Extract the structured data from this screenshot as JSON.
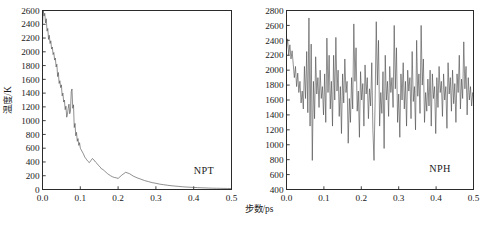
{
  "figure": {
    "axis_x_title": "步数/ps",
    "axis_y_title": "温度/K",
    "line_color": "#4a4a4a",
    "axis_color": "#2b2b2b",
    "background": "#ffffff"
  },
  "panels": {
    "left": {
      "annotation": "NPT"
    },
    "right": {
      "annotation": "NPH"
    }
  },
  "chart_data": [
    {
      "type": "line",
      "title": "",
      "annotation": "NPT",
      "xlabel": "步数/ps",
      "ylabel": "温度/K",
      "xlim": [
        0.0,
        0.5
      ],
      "ylim": [
        0,
        2600
      ],
      "xticks": [
        0.0,
        0.1,
        0.2,
        0.3,
        0.4,
        0.5
      ],
      "xtick_labels": [
        "0.0",
        "0.1",
        "0.2",
        "0.3",
        "0.4",
        "0.5"
      ],
      "yticks": [
        0,
        200,
        400,
        600,
        800,
        1000,
        1200,
        1400,
        1600,
        1800,
        2000,
        2200,
        2400,
        2600
      ],
      "ytick_labels": [
        "0",
        "200",
        "400",
        "600",
        "800",
        "1000",
        "1200",
        "1400",
        "1600",
        "1800",
        "2000",
        "2200",
        "2400",
        "2600"
      ],
      "grid": false,
      "legend": "none",
      "series": [
        {
          "name": "NPT temperature",
          "x": [
            0.0,
            0.002,
            0.004,
            0.006,
            0.008,
            0.01,
            0.012,
            0.014,
            0.016,
            0.018,
            0.02,
            0.022,
            0.024,
            0.026,
            0.028,
            0.03,
            0.032,
            0.034,
            0.036,
            0.038,
            0.04,
            0.042,
            0.044,
            0.046,
            0.048,
            0.05,
            0.052,
            0.054,
            0.056,
            0.058,
            0.06,
            0.062,
            0.064,
            0.066,
            0.068,
            0.07,
            0.072,
            0.074,
            0.076,
            0.078,
            0.08,
            0.082,
            0.084,
            0.086,
            0.088,
            0.09,
            0.092,
            0.094,
            0.096,
            0.098,
            0.1,
            0.104,
            0.108,
            0.112,
            0.116,
            0.12,
            0.124,
            0.128,
            0.132,
            0.136,
            0.14,
            0.144,
            0.148,
            0.152,
            0.156,
            0.16,
            0.164,
            0.168,
            0.172,
            0.176,
            0.18,
            0.185,
            0.19,
            0.195,
            0.2,
            0.21,
            0.22,
            0.23,
            0.24,
            0.25,
            0.26,
            0.27,
            0.28,
            0.29,
            0.3,
            0.31,
            0.32,
            0.33,
            0.34,
            0.35,
            0.36,
            0.37,
            0.38,
            0.39,
            0.4,
            0.41,
            0.42,
            0.43,
            0.44,
            0.45,
            0.46,
            0.47,
            0.48,
            0.49,
            0.5
          ],
          "y": [
            2380,
            2600,
            2520,
            2560,
            2420,
            2480,
            2300,
            2340,
            2180,
            2240,
            2120,
            2160,
            2040,
            2070,
            1960,
            1990,
            1880,
            1910,
            1780,
            1820,
            1640,
            1700,
            1540,
            1580,
            1480,
            1520,
            1360,
            1400,
            1270,
            1300,
            1160,
            1210,
            1050,
            1090,
            1180,
            1240,
            1100,
            1140,
            1420,
            1460,
            1180,
            1230,
            900,
            960,
            780,
            830,
            700,
            740,
            640,
            680,
            600,
            560,
            520,
            470,
            440,
            410,
            390,
            420,
            450,
            430,
            400,
            380,
            350,
            330,
            300,
            290,
            270,
            250,
            230,
            215,
            200,
            185,
            175,
            170,
            160,
            210,
            250,
            230,
            195,
            170,
            150,
            130,
            115,
            100,
            90,
            78,
            70,
            62,
            55,
            50,
            45,
            40,
            36,
            33,
            30,
            27,
            25,
            23,
            21,
            19,
            18,
            17,
            16,
            15,
            14
          ]
        }
      ]
    },
    {
      "type": "line",
      "title": "",
      "annotation": "NPH",
      "xlabel": "步数/ps",
      "ylabel": "温度/K",
      "xlim": [
        0.0,
        0.5
      ],
      "ylim": [
        400,
        2800
      ],
      "xticks": [
        0.0,
        0.1,
        0.2,
        0.3,
        0.4,
        0.5
      ],
      "xtick_labels": [
        "0.0",
        "0.1",
        "0.2",
        "0.3",
        "0.4",
        "0.5"
      ],
      "yticks": [
        400,
        600,
        800,
        1000,
        1200,
        1400,
        1600,
        1800,
        2000,
        2200,
        2400,
        2600,
        2800
      ],
      "ytick_labels": [
        "400",
        "600",
        "800",
        "1000",
        "1200",
        "1400",
        "1600",
        "1800",
        "2000",
        "2200",
        "2400",
        "2600",
        "2800"
      ],
      "grid": false,
      "legend": "none",
      "series": [
        {
          "name": "NPH temperature",
          "x": [
            0.0,
            0.003,
            0.006,
            0.009,
            0.012,
            0.015,
            0.018,
            0.021,
            0.024,
            0.027,
            0.03,
            0.033,
            0.036,
            0.039,
            0.042,
            0.045,
            0.048,
            0.051,
            0.054,
            0.057,
            0.06,
            0.063,
            0.066,
            0.069,
            0.072,
            0.075,
            0.078,
            0.081,
            0.084,
            0.087,
            0.09,
            0.093,
            0.096,
            0.099,
            0.102,
            0.105,
            0.108,
            0.111,
            0.114,
            0.117,
            0.12,
            0.123,
            0.126,
            0.129,
            0.132,
            0.135,
            0.138,
            0.141,
            0.144,
            0.147,
            0.15,
            0.153,
            0.156,
            0.159,
            0.162,
            0.165,
            0.168,
            0.171,
            0.174,
            0.177,
            0.18,
            0.183,
            0.186,
            0.189,
            0.192,
            0.195,
            0.198,
            0.201,
            0.204,
            0.207,
            0.21,
            0.213,
            0.216,
            0.219,
            0.222,
            0.225,
            0.228,
            0.231,
            0.234,
            0.237,
            0.24,
            0.243,
            0.246,
            0.249,
            0.252,
            0.255,
            0.258,
            0.261,
            0.264,
            0.267,
            0.27,
            0.273,
            0.276,
            0.279,
            0.282,
            0.285,
            0.288,
            0.291,
            0.294,
            0.297,
            0.3,
            0.303,
            0.306,
            0.309,
            0.312,
            0.315,
            0.318,
            0.321,
            0.324,
            0.327,
            0.33,
            0.333,
            0.336,
            0.339,
            0.342,
            0.345,
            0.348,
            0.351,
            0.354,
            0.357,
            0.36,
            0.363,
            0.366,
            0.369,
            0.372,
            0.375,
            0.378,
            0.381,
            0.384,
            0.387,
            0.39,
            0.393,
            0.396,
            0.399,
            0.402,
            0.405,
            0.408,
            0.411,
            0.414,
            0.417,
            0.42,
            0.423,
            0.426,
            0.429,
            0.432,
            0.435,
            0.438,
            0.441,
            0.444,
            0.447,
            0.45,
            0.453,
            0.456,
            0.459,
            0.462,
            0.465,
            0.468,
            0.471,
            0.474,
            0.477,
            0.48,
            0.483,
            0.486,
            0.489,
            0.492,
            0.495,
            0.498,
            0.5
          ],
          "y": [
            2280,
            2420,
            2200,
            2340,
            2150,
            2260,
            2080,
            1900,
            2050,
            1780,
            1960,
            1700,
            1850,
            1560,
            1720,
            1480,
            2050,
            1620,
            2250,
            1430,
            2700,
            1250,
            2350,
            790,
            1850,
            1350,
            2180,
            1680,
            1900,
            1500,
            2000,
            1620,
            1780,
            1400,
            1950,
            1300,
            2430,
            1700,
            2200,
            1480,
            1850,
            1250,
            2200,
            1600,
            2440,
            1720,
            2000,
            1380,
            1780,
            1150,
            1950,
            1560,
            2150,
            1700,
            1850,
            1020,
            1620,
            1300,
            1900,
            1480,
            2620,
            1850,
            2300,
            1450,
            1720,
            1100,
            1980,
            1600,
            1820,
            1250,
            2070,
            1680,
            1900,
            1350,
            1750,
            1520,
            2100,
            1200,
            790,
            1600,
            2650,
            1800,
            2400,
            1250,
            1700,
            1420,
            1980,
            950,
            2200,
            1600,
            1850,
            1380,
            2050,
            1700,
            1900,
            1500,
            2600,
            1750,
            2300,
            1300,
            1680,
            1100,
            1950,
            1600,
            2100,
            1480,
            1850,
            1250,
            2000,
            1720,
            1900,
            1350,
            2250,
            1580,
            1780,
            1200,
            2400,
            1650,
            1950,
            1420,
            2600,
            1800,
            2150,
            1300,
            1700,
            1450,
            1880,
            1520,
            2000,
            1250,
            1950,
            1620,
            1780,
            1150,
            1900,
            1500,
            2050,
            1700,
            1850,
            1380,
            1950,
            1600,
            1780,
            1220,
            2100,
            1680,
            1900,
            1450,
            2000,
            1550,
            1820,
            1300,
            1950,
            1700,
            2200,
            1480,
            1880,
            1620,
            2380,
            1750,
            2050,
            1400,
            1900,
            1600,
            1780,
            1520,
            1700,
            1650
          ]
        }
      ]
    }
  ]
}
